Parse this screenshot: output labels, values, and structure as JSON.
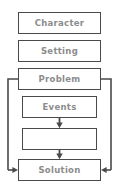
{
  "diagram": {
    "type": "flowchart",
    "colors": {
      "box_border": "#4a4a4a",
      "box_fill": "#ffffff",
      "text": "#8c8c8c",
      "connector": "#4a4a4a",
      "background": "#ffffff"
    },
    "nodes": [
      {
        "id": "character",
        "label": "Character",
        "x": 18,
        "y": 12,
        "w": 83,
        "h": 22
      },
      {
        "id": "setting",
        "label": "Setting",
        "x": 18,
        "y": 40,
        "w": 83,
        "h": 22
      },
      {
        "id": "problem",
        "label": "Problem",
        "x": 18,
        "y": 68,
        "w": 83,
        "h": 22
      },
      {
        "id": "events",
        "label": "Events",
        "x": 22,
        "y": 96,
        "w": 75,
        "h": 22
      },
      {
        "id": "blank",
        "label": "",
        "x": 22,
        "y": 128,
        "w": 75,
        "h": 22
      },
      {
        "id": "solution",
        "label": "Solution",
        "x": 18,
        "y": 159,
        "w": 83,
        "h": 22
      }
    ],
    "connectors": [
      {
        "id": "events-to-blank",
        "kind": "arrow-down",
        "from": "events",
        "to": "blank"
      },
      {
        "id": "blank-to-solution",
        "kind": "arrow-down",
        "from": "blank",
        "to": "solution"
      },
      {
        "id": "problem-left-branch",
        "kind": "arrow-elbow-left",
        "from": "problem",
        "to": "solution"
      },
      {
        "id": "problem-right-branch",
        "kind": "arrow-elbow-right",
        "from": "problem",
        "to": "solution"
      }
    ]
  }
}
